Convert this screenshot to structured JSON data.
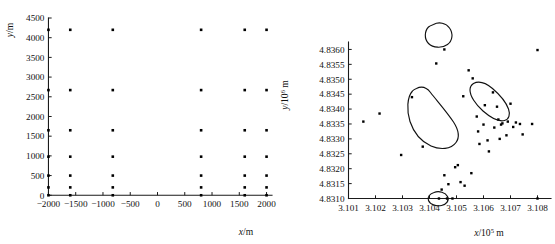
{
  "figure": {
    "background": "#ffffff",
    "point_color": "#000000",
    "axis_color": "#1a1a1a"
  },
  "chart_data": [
    {
      "type": "scatter",
      "panel": "left",
      "title": "",
      "xlabel": "x/m",
      "ylabel": "y/m",
      "xlabel_parts": {
        "symbol": "x",
        "unit": "/m"
      },
      "ylabel_parts": {
        "symbol": "y",
        "unit": "/m"
      },
      "xlim": [
        -2100,
        2100
      ],
      "ylim": [
        -120,
        4500
      ],
      "xticks": [
        -2000,
        -1500,
        -1000,
        -500,
        0,
        500,
        1000,
        1500,
        2000
      ],
      "xticklabels": [
        "−2000",
        "−1500",
        "−1000",
        "−500",
        "0",
        "500",
        "1000",
        "1500",
        "2000"
      ],
      "yticks": [
        0,
        500,
        1000,
        1500,
        2000,
        2500,
        3000,
        3500,
        4000,
        4500
      ],
      "yticklabels": [
        "0",
        "500",
        "1000",
        "1500",
        "2000",
        "2500",
        "3000",
        "3500",
        "4000",
        "4500"
      ],
      "grid": false,
      "legend": "none",
      "marker": "square",
      "marker_size": 2.6,
      "x": [
        -2000,
        -2000,
        -2000,
        -2000,
        -2000,
        -2000,
        -2000,
        -1600,
        -1600,
        -1600,
        -1600,
        -1600,
        -1600,
        -1600,
        -820,
        -820,
        -820,
        -820,
        -820,
        -820,
        -820,
        800,
        800,
        800,
        800,
        800,
        800,
        800,
        1600,
        1600,
        1600,
        1600,
        1600,
        1600,
        1600,
        2000,
        2000,
        2000,
        2000,
        2000,
        2000,
        2000
      ],
      "y": [
        0,
        200,
        500,
        980,
        1650,
        2670,
        4200,
        0,
        200,
        500,
        980,
        1650,
        2670,
        4200,
        0,
        200,
        500,
        980,
        1650,
        2670,
        4200,
        0,
        200,
        500,
        980,
        1650,
        2670,
        4200,
        0,
        200,
        500,
        980,
        1650,
        2670,
        4200,
        0,
        200,
        500,
        980,
        1650,
        2670,
        4200
      ]
    },
    {
      "type": "scatter",
      "panel": "right",
      "title": "",
      "xlabel": "x/10^5 m",
      "ylabel": "y/10^6 m",
      "xlabel_parts": {
        "symbol": "x",
        "unit": "/10",
        "exponent": "5",
        "unit_tail": "m"
      },
      "ylabel_parts": {
        "symbol": "y",
        "unit": "/10",
        "exponent": "6",
        "unit_tail": "m"
      },
      "xlim": [
        3.1005,
        3.1085
      ],
      "ylim": [
        4.83095,
        4.83625
      ],
      "xticks": [
        3.101,
        3.102,
        3.103,
        3.104,
        3.105,
        3.106,
        3.107,
        3.108
      ],
      "xticklabels": [
        "3.101",
        "3.102",
        "3.103",
        "3.104",
        "3.105",
        "3.106",
        "3.107",
        "3.108"
      ],
      "yticks": [
        4.831,
        4.8315,
        4.832,
        4.8325,
        4.833,
        4.8335,
        4.834,
        4.8345,
        4.835,
        4.8355,
        4.836
      ],
      "yticklabels": [
        "4.8310",
        "4.8315",
        "4.8320",
        "4.8325",
        "4.8330",
        "4.8335",
        "4.8340",
        "4.8345",
        "4.8350",
        "4.8355",
        "4.8360"
      ],
      "grid": false,
      "legend": "none",
      "marker": "square",
      "marker_size": 2.4,
      "x": [
        3.10155,
        3.10215,
        3.10295,
        3.10335,
        3.10375,
        3.10425,
        3.10455,
        3.10465,
        3.10485,
        3.10495,
        3.10455,
        3.10445,
        3.10435,
        3.1047,
        3.10505,
        3.10515,
        3.10525,
        3.1053,
        3.10545,
        3.10555,
        3.1056,
        3.10575,
        3.1058,
        3.10585,
        3.106,
        3.10605,
        3.10615,
        3.1062,
        3.10635,
        3.1064,
        3.1065,
        3.10655,
        3.1066,
        3.10665,
        3.1067,
        3.10685,
        3.1069,
        3.107,
        3.1071,
        3.1072,
        3.10735,
        3.10745,
        3.1078,
        3.108,
        3.108
      ],
      "y": [
        4.83358,
        4.83385,
        4.83246,
        4.8344,
        4.83274,
        4.83553,
        4.836,
        4.831,
        4.831,
        4.83205,
        4.83178,
        4.8313,
        4.831,
        4.83148,
        4.83212,
        4.83155,
        4.83443,
        4.83143,
        4.8353,
        4.83185,
        4.83503,
        4.83375,
        4.83325,
        4.83283,
        4.83348,
        4.83413,
        4.83295,
        4.83258,
        4.83456,
        4.83338,
        4.83408,
        4.83365,
        4.833,
        4.83348,
        4.83352,
        4.83312,
        4.83358,
        4.83418,
        4.8334,
        4.83355,
        4.8335,
        4.83315,
        4.8335,
        4.83598,
        4.831
      ],
      "annotations": [
        {
          "name": "cluster-outline-top",
          "shape": "closed-curve",
          "center_x": 3.10455,
          "center_y": 4.836
        },
        {
          "name": "cluster-outline-center",
          "shape": "closed-curve",
          "center_x": 3.10525,
          "center_y": 4.8332
        },
        {
          "name": "cluster-outline-right",
          "shape": "closed-curve",
          "center_x": 3.10645,
          "center_y": 4.83385
        },
        {
          "name": "cluster-outline-bottom",
          "shape": "closed-curve",
          "center_x": 3.10465,
          "center_y": 4.831
        }
      ]
    }
  ]
}
